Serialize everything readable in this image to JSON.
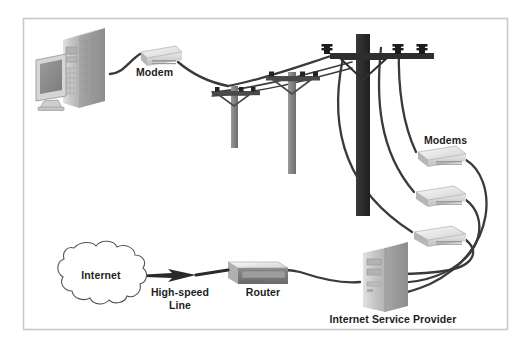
{
  "figure": {
    "frame": {
      "x": 23,
      "y": 18,
      "width": 485,
      "height": 312,
      "border_color": "#c9c9c9",
      "background": "#ffffff"
    }
  },
  "labels": {
    "modem": "Modem",
    "modems": "Modems",
    "internet": "Internet",
    "high_speed_line_1": "High-speed",
    "high_speed_line_2": "Line",
    "router": "Router",
    "isp": "Internet Service Provider"
  },
  "colors": {
    "text": "#1d1d1d",
    "cable": "#3a3a3a",
    "pole_light": "#8a8a8a",
    "pole_dark": "#2e2e2e",
    "crossarm": "#4a4a4a",
    "insulator": "#232323",
    "device_face": "#d8d8d8",
    "device_top": "#f0f0f0",
    "device_side": "#a8a8a8",
    "device_stripe": "#9a9a9a",
    "tower_front": "#c7c7c7",
    "tower_side": "#9d9d9d",
    "tower_top": "#e4e4e4",
    "screen": "#8f8f8f",
    "router_front": "#7d7d7d",
    "router_top": "#d0d0d0",
    "cloud_stroke": "#555555",
    "arrow": "#2a2a2a"
  },
  "nodes": [
    {
      "id": "workstation",
      "name": "desktop-computer",
      "label": "",
      "x": 36,
      "y": 30
    },
    {
      "id": "modem-home",
      "name": "home-modem",
      "label": "Modem",
      "x": 138,
      "y": 44
    },
    {
      "id": "pole-1",
      "name": "utility-pole-small",
      "label": "",
      "x": 234,
      "y": 78
    },
    {
      "id": "pole-2",
      "name": "utility-pole-medium",
      "label": "",
      "x": 292,
      "y": 64
    },
    {
      "id": "pole-3",
      "name": "utility-pole-main",
      "label": "",
      "x": 362,
      "y": 34
    },
    {
      "id": "modem-1",
      "name": "subscriber-modem-1",
      "label": "Modems",
      "x": 420,
      "y": 148
    },
    {
      "id": "modem-2",
      "name": "subscriber-modem-2",
      "label": "",
      "x": 420,
      "y": 188
    },
    {
      "id": "modem-3",
      "name": "subscriber-modem-3",
      "label": "",
      "x": 420,
      "y": 228
    },
    {
      "id": "isp-server",
      "name": "isp-server-tower",
      "label": "Internet Service Provider",
      "x": 363,
      "y": 242
    },
    {
      "id": "router",
      "name": "router-device",
      "label": "Router",
      "x": 228,
      "y": 262
    },
    {
      "id": "internet-cloud",
      "name": "internet-cloud",
      "label": "Internet",
      "x": 42,
      "y": 245
    }
  ],
  "connections": [
    {
      "from": "workstation",
      "to": "modem-home",
      "name": "cable-pc-to-modem"
    },
    {
      "from": "modem-home",
      "to": "pole-1",
      "name": "cable-modem-to-pole"
    },
    {
      "from": "pole-3",
      "to": "modem-1",
      "name": "cable-pole-to-modem-1"
    },
    {
      "from": "pole-3",
      "to": "modem-2",
      "name": "cable-pole-to-modem-2"
    },
    {
      "from": "pole-3",
      "to": "modem-3",
      "name": "cable-pole-to-modem-3"
    },
    {
      "from": "modem-1",
      "to": "isp-server",
      "name": "cable-modem-1-to-isp"
    },
    {
      "from": "modem-2",
      "to": "isp-server",
      "name": "cable-modem-2-to-isp"
    },
    {
      "from": "modem-3",
      "to": "isp-server",
      "name": "cable-modem-3-to-isp"
    },
    {
      "from": "isp-server",
      "to": "router",
      "name": "cable-isp-to-router"
    },
    {
      "from": "router",
      "to": "internet-cloud",
      "name": "high-speed-line-arrow"
    }
  ]
}
